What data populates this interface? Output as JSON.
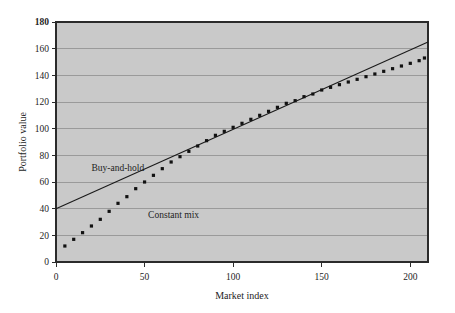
{
  "chart_data": {
    "type": "line",
    "title": "",
    "xlabel": "Market index",
    "ylabel": "Portfolio value",
    "xlim": [
      0,
      210
    ],
    "ylim": [
      0,
      180
    ],
    "grid": "horizontal",
    "legend_position": "inline-annotations",
    "plot_background": "#c9c9c9",
    "x_ticks": [
      0,
      50,
      100,
      150,
      200
    ],
    "x_tick_labels": [
      "0",
      "50",
      "100",
      "150",
      "200"
    ],
    "y_ticks": [
      0,
      20,
      40,
      60,
      80,
      100,
      120,
      140,
      160,
      180
    ],
    "y_tick_labels": [
      "0",
      "20",
      "40",
      "60",
      "80",
      "100",
      "120",
      "140",
      "160",
      "180"
    ],
    "y_tick_bold": [
      180
    ],
    "series": [
      {
        "name": "Buy-and-hold",
        "style": "solid-line",
        "color": "#1a1a1a",
        "x": [
          0,
          210
        ],
        "values": [
          40,
          165
        ]
      },
      {
        "name": "Constant mix",
        "style": "dotted-markers",
        "color": "#111111",
        "x": [
          5,
          10,
          15,
          20,
          25,
          30,
          35,
          40,
          45,
          50,
          55,
          60,
          65,
          70,
          75,
          80,
          85,
          90,
          95,
          100,
          105,
          110,
          115,
          120,
          125,
          130,
          135,
          140,
          145,
          150,
          155,
          160,
          165,
          170,
          175,
          180,
          185,
          190,
          195,
          200,
          205,
          208
        ],
        "values": [
          12,
          17,
          22,
          27,
          32,
          38,
          44,
          49,
          55,
          60,
          65,
          70,
          75,
          79,
          83,
          87,
          91,
          95,
          98,
          101,
          104,
          107,
          110,
          113,
          116,
          119,
          121,
          124,
          126,
          129,
          131,
          133,
          135,
          137,
          139,
          141,
          143,
          145,
          147,
          149,
          151,
          153
        ]
      }
    ],
    "annotations": [
      {
        "text": "Buy-and-hold",
        "x": 20,
        "y": 68
      },
      {
        "text": "Constant mix",
        "x": 52,
        "y": 33
      }
    ]
  }
}
